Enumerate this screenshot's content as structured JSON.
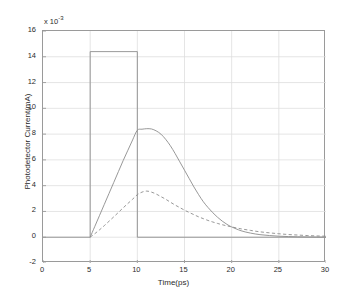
{
  "chart_data": {
    "type": "line",
    "title": "",
    "xlabel": "Time(ps)",
    "ylabel": "Photodetector Current(mA)",
    "y_exponent_label": "x 10",
    "y_exponent_value": "-3",
    "xlim": [
      0,
      30
    ],
    "ylim": [
      -2,
      16
    ],
    "xticks": [
      0,
      5,
      10,
      15,
      20,
      25,
      30
    ],
    "yticks": [
      -2,
      0,
      2,
      4,
      6,
      8,
      10,
      12,
      14,
      16
    ],
    "grid": true,
    "legend": "none",
    "series": [
      {
        "name": "optical-input-pulse",
        "style": "solid",
        "color": "#8c8c8c",
        "points": [
          [
            0,
            0
          ],
          [
            5,
            0
          ],
          [
            5,
            14.4
          ],
          [
            10,
            14.4
          ],
          [
            10,
            0
          ],
          [
            30,
            0
          ]
        ]
      },
      {
        "name": "photodetector-current-fast",
        "style": "solid",
        "color": "#8c8c8c",
        "points": [
          [
            5.0,
            0.0
          ],
          [
            5.5,
            0.85
          ],
          [
            6.0,
            1.7
          ],
          [
            6.5,
            2.55
          ],
          [
            7.0,
            3.4
          ],
          [
            7.5,
            4.25
          ],
          [
            8.0,
            5.1
          ],
          [
            8.5,
            5.95
          ],
          [
            9.0,
            6.75
          ],
          [
            9.5,
            7.55
          ],
          [
            10.0,
            8.3
          ],
          [
            10.5,
            8.38
          ],
          [
            11.0,
            8.42
          ],
          [
            11.5,
            8.4
          ],
          [
            12.0,
            8.25
          ],
          [
            12.5,
            8.0
          ],
          [
            13.0,
            7.6
          ],
          [
            13.5,
            7.1
          ],
          [
            14.0,
            6.5
          ],
          [
            14.5,
            5.85
          ],
          [
            15.0,
            5.2
          ],
          [
            15.5,
            4.55
          ],
          [
            16.0,
            3.9
          ],
          [
            16.5,
            3.3
          ],
          [
            17.0,
            2.75
          ],
          [
            17.5,
            2.3
          ],
          [
            18.0,
            1.9
          ],
          [
            18.5,
            1.55
          ],
          [
            19.0,
            1.25
          ],
          [
            19.5,
            1.0
          ],
          [
            20.0,
            0.8
          ],
          [
            21.0,
            0.5
          ],
          [
            22.0,
            0.32
          ],
          [
            23.0,
            0.2
          ],
          [
            24.0,
            0.13
          ],
          [
            25.0,
            0.08
          ],
          [
            26.0,
            0.05
          ],
          [
            27.0,
            0.03
          ],
          [
            28.0,
            0.02
          ],
          [
            29.0,
            0.01
          ],
          [
            30.0,
            0.01
          ]
        ]
      },
      {
        "name": "photodetector-current-slow",
        "style": "dashed",
        "color": "#8c8c8c",
        "points": [
          [
            5.0,
            0.0
          ],
          [
            5.5,
            0.28
          ],
          [
            6.0,
            0.58
          ],
          [
            6.5,
            0.9
          ],
          [
            7.0,
            1.24
          ],
          [
            7.5,
            1.58
          ],
          [
            8.0,
            1.93
          ],
          [
            8.5,
            2.28
          ],
          [
            9.0,
            2.62
          ],
          [
            9.5,
            2.95
          ],
          [
            10.0,
            3.3
          ],
          [
            10.5,
            3.5
          ],
          [
            11.0,
            3.58
          ],
          [
            11.5,
            3.5
          ],
          [
            12.0,
            3.35
          ],
          [
            12.5,
            3.15
          ],
          [
            13.0,
            2.95
          ],
          [
            13.5,
            2.72
          ],
          [
            14.0,
            2.5
          ],
          [
            14.5,
            2.3
          ],
          [
            15.0,
            2.1
          ],
          [
            15.5,
            1.92
          ],
          [
            16.0,
            1.75
          ],
          [
            16.5,
            1.58
          ],
          [
            17.0,
            1.44
          ],
          [
            17.5,
            1.3
          ],
          [
            18.0,
            1.18
          ],
          [
            18.5,
            1.07
          ],
          [
            19.0,
            0.97
          ],
          [
            19.5,
            0.88
          ],
          [
            20.0,
            0.8
          ],
          [
            21.0,
            0.65
          ],
          [
            22.0,
            0.53
          ],
          [
            23.0,
            0.42
          ],
          [
            24.0,
            0.34
          ],
          [
            25.0,
            0.27
          ],
          [
            26.0,
            0.21
          ],
          [
            27.0,
            0.17
          ],
          [
            28.0,
            0.13
          ],
          [
            29.0,
            0.1
          ],
          [
            30.0,
            0.08
          ]
        ]
      }
    ]
  },
  "axes": {
    "xticklabels": [
      "0",
      "5",
      "10",
      "15",
      "20",
      "25",
      "30"
    ],
    "yticklabels": [
      "16",
      "14",
      "12",
      "10",
      "8",
      "6",
      "4",
      "2",
      "0",
      "-2"
    ],
    "xlabel": "Time(ps)",
    "ylabel": "Photodetector Current(mA)",
    "exponent_prefix": "x 10",
    "exponent_sup": "-3"
  },
  "colors": {
    "line": "#8c8c8c",
    "axis": "#9a9a9a",
    "grid": "#dedede",
    "text": "#2b2b2b",
    "background": "#ffffff"
  }
}
